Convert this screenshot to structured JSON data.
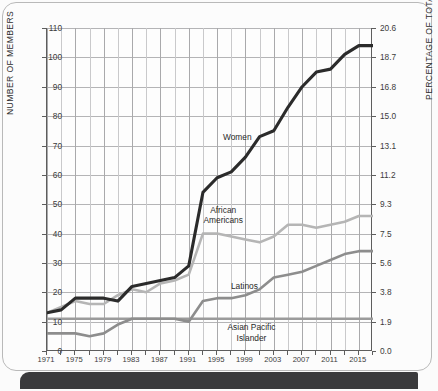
{
  "chart_data": {
    "type": "line",
    "title": "",
    "xlabel": "",
    "ylabel": "NUMBER OF MEMBERS",
    "y2label": "PERCENTAGE OF TOTAL MEMBERS",
    "xlim": [
      1971,
      2017
    ],
    "ylim": [
      0,
      110
    ],
    "y2lim": [
      0.0,
      20.6
    ],
    "grid": true,
    "legend_position": "inline-annotations",
    "yticks": [
      0,
      10,
      20,
      30,
      40,
      50,
      60,
      70,
      80,
      90,
      100,
      110
    ],
    "yticklabels": [
      "0",
      "10",
      "20",
      "30",
      "40",
      "50",
      "60",
      "70",
      "80",
      "90",
      "100",
      "110"
    ],
    "y2ticks": [
      0.0,
      1.9,
      3.8,
      5.6,
      7.5,
      9.3,
      11.2,
      13.1,
      15.0,
      16.8,
      18.7,
      20.6
    ],
    "y2ticklabels": [
      "0.0",
      "1.9",
      "3.8",
      "5.6",
      "7.5",
      "9.3",
      "11.2",
      "13.1",
      "15.0",
      "16.8",
      "18.7",
      "20.6"
    ],
    "xticks": [
      1971,
      1975,
      1979,
      1983,
      1987,
      1991,
      1995,
      1999,
      2003,
      2007,
      2011,
      2015
    ],
    "xticklabels": [
      "1971",
      "1975",
      "1979",
      "1983",
      "1987",
      "1991",
      "1995",
      "1999",
      "2003",
      "2007",
      "2011",
      "2015"
    ],
    "x": [
      1971,
      1973,
      1975,
      1977,
      1979,
      1981,
      1983,
      1985,
      1987,
      1989,
      1991,
      1993,
      1995,
      1997,
      1999,
      2001,
      2003,
      2005,
      2007,
      2009,
      2011,
      2013,
      2015,
      2017
    ],
    "series": [
      {
        "name": "Women",
        "color": "#2b2b2b",
        "values": [
          13,
          14,
          18,
          18,
          18,
          17,
          22,
          23,
          24,
          25,
          29,
          54,
          59,
          61,
          66,
          73,
          75,
          83,
          90,
          95,
          96,
          101,
          104,
          104
        ]
      },
      {
        "name": "African Americans",
        "color": "#b5b5b5",
        "values": [
          13,
          15,
          17,
          16,
          16,
          19,
          21,
          20,
          23,
          24,
          26,
          40,
          40,
          39,
          38,
          37,
          39,
          43,
          43,
          42,
          43,
          44,
          46,
          46
        ]
      },
      {
        "name": "Latinos",
        "color": "#8d8d8d",
        "values": [
          6,
          6,
          6,
          5,
          6,
          9,
          11,
          11,
          11,
          11,
          10,
          17,
          18,
          18,
          19,
          21,
          25,
          26,
          27,
          29,
          31,
          33,
          34,
          34
        ]
      },
      {
        "name": "Asian Pacific Islander",
        "color": "#9b9b9b",
        "values": [
          11,
          11,
          11,
          11,
          11,
          11,
          11,
          11,
          11,
          11,
          11,
          11,
          11,
          11,
          11,
          11,
          11,
          11,
          11,
          11,
          11,
          11,
          11,
          11
        ]
      }
    ],
    "annotations": [
      {
        "label": "Women",
        "x": 1998,
        "y": 73
      },
      {
        "label": "African\nAmericans",
        "x": 1996,
        "y": 46
      },
      {
        "label": "Latinos",
        "x": 1999,
        "y": 22
      },
      {
        "label": "Asian Pacific\nIslander",
        "x": 2000,
        "y": 6
      }
    ]
  },
  "annotation_text": {
    "women": "Women",
    "african_americans_line1": "African",
    "african_americans_line2": "Americans",
    "latinos": "Latinos",
    "asian_line1": "Asian Pacific",
    "asian_line2": "Islander"
  }
}
